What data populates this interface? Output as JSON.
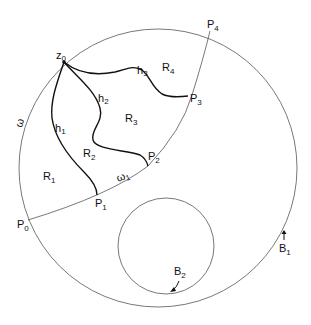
{
  "figure": {
    "outer_boundary": {
      "label": "B",
      "subscript": "1"
    },
    "inner_boundary": {
      "label": "B",
      "subscript": "2"
    },
    "crosscut_outer": {
      "label": "ω"
    },
    "crosscut_inner": {
      "label": "ω",
      "subscript": "1"
    },
    "vertex": {
      "label": "z",
      "subscript": "0"
    },
    "points": [
      {
        "label": "P",
        "subscript": "0"
      },
      {
        "label": "P",
        "subscript": "1"
      },
      {
        "label": "P",
        "subscript": "2"
      },
      {
        "label": "P",
        "subscript": "3"
      },
      {
        "label": "P",
        "subscript": "4"
      }
    ],
    "curves": [
      {
        "label": "h",
        "subscript": "1"
      },
      {
        "label": "h",
        "subscript": "2"
      },
      {
        "label": "h",
        "subscript": "3"
      }
    ],
    "regions": [
      {
        "label": "R",
        "subscript": "1"
      },
      {
        "label": "R",
        "subscript": "2"
      },
      {
        "label": "R",
        "subscript": "3"
      },
      {
        "label": "R",
        "subscript": "4"
      }
    ]
  }
}
